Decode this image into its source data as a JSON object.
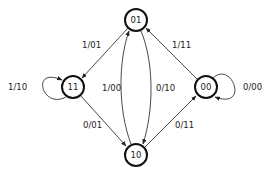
{
  "diagram": {
    "type": "state-transition-diagram",
    "nodes": [
      {
        "id": "01",
        "label": "01",
        "x": 136,
        "y": 20
      },
      {
        "id": "11",
        "label": "11",
        "x": 73,
        "y": 87
      },
      {
        "id": "00",
        "label": "00",
        "x": 206,
        "y": 87
      },
      {
        "id": "10",
        "label": "10",
        "x": 136,
        "y": 155
      }
    ],
    "edges": [
      {
        "from": "01",
        "to": "11",
        "label": "1/01"
      },
      {
        "from": "11",
        "to": "11",
        "label": "1/10"
      },
      {
        "from": "11",
        "to": "10",
        "label": "0/01"
      },
      {
        "from": "10",
        "to": "01",
        "label": "1/00"
      },
      {
        "from": "01",
        "to": "10",
        "label": "0/10"
      },
      {
        "from": "10",
        "to": "00",
        "label": "0/11"
      },
      {
        "from": "00",
        "to": "01",
        "label": "1/11"
      },
      {
        "from": "00",
        "to": "00",
        "label": "0/00"
      }
    ]
  }
}
